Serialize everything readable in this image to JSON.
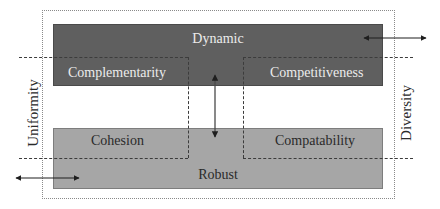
{
  "diagram": {
    "title": "",
    "boxes": {
      "dynamic": {
        "label": "Dynamic",
        "color": "#5f5f5f"
      },
      "robust": {
        "label": "Robust",
        "color": "#a6a6a6"
      }
    },
    "quadrants": {
      "top_left": "Complementarity",
      "top_right": "Competitiveness",
      "bottom_left": "Cohesion",
      "bottom_right": "Compatability"
    },
    "axes": {
      "left": "Uniformity",
      "right": "Diversity"
    },
    "arrows": [
      {
        "name": "vertical-double-arrow",
        "between": [
          "Dynamic",
          "Robust"
        ]
      },
      {
        "name": "right-horizontal-double-arrow",
        "location": "Dynamic right edge"
      },
      {
        "name": "left-horizontal-double-arrow",
        "location": "Robust left edge"
      }
    ]
  }
}
